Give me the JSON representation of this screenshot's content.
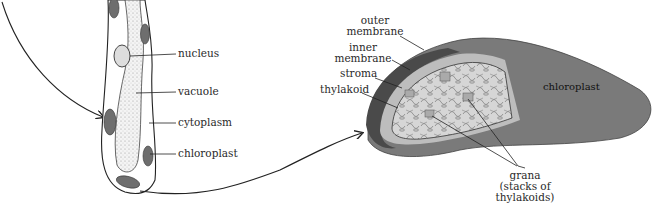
{
  "diagram": {
    "cell": {
      "labels": [
        {
          "id": "nucleus",
          "text": "nucleus"
        },
        {
          "id": "vacuole",
          "text": "vacuole"
        },
        {
          "id": "cytoplasm",
          "text": "cytoplasm"
        },
        {
          "id": "chloroplast",
          "text": "chloroplast"
        }
      ]
    },
    "chloroplast": {
      "body_label": "chloroplast",
      "labels": [
        {
          "id": "outer-membrane",
          "line1": "outer",
          "line2": "membrane"
        },
        {
          "id": "inner-membrane",
          "line1": "inner",
          "line2": "membrane"
        },
        {
          "id": "stroma",
          "text": "stroma"
        },
        {
          "id": "thylakoid",
          "text": "thylakoid"
        },
        {
          "id": "grana",
          "line1": "grana",
          "line2": "(stacks of",
          "line3": "thylakoids)"
        }
      ]
    },
    "colors": {
      "chloroplast_body": "#7a7a7a",
      "outer_rim": "#505050",
      "interior": "#d9d9d9",
      "cell_chloroplast": "#6e6e6e",
      "line": "#222222"
    }
  }
}
